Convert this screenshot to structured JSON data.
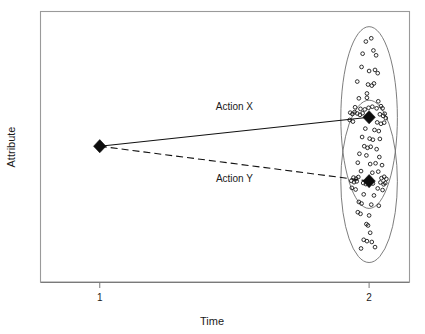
{
  "chart_data": {
    "type": "scatter",
    "title": "",
    "xlabel": "Time",
    "ylabel": "Attribute",
    "xlim": [
      0.78,
      2.15
    ],
    "ylim": [
      0,
      100
    ],
    "grid": false,
    "legend": null,
    "x_ticks": [
      {
        "value": 1,
        "label": "1"
      },
      {
        "value": 2,
        "label": "2"
      }
    ],
    "y_ticks": [],
    "annotations": [
      {
        "text": "Action X",
        "x": 1.5,
        "y": 63.5
      },
      {
        "text": "Action Y",
        "x": 1.5,
        "y": 37.0
      }
    ],
    "series": [
      {
        "name": "Action X",
        "type": "line",
        "style": "solid",
        "marker": "filled-diamond",
        "points": [
          {
            "x": 1.0,
            "y": 50.2
          },
          {
            "x": 2.0,
            "y": 60.9
          }
        ]
      },
      {
        "name": "Action Y",
        "type": "line",
        "style": "dashed",
        "marker": "filled-diamond",
        "points": [
          {
            "x": 1.0,
            "y": 50.2
          },
          {
            "x": 2.0,
            "y": 37.3
          }
        ]
      }
    ],
    "clusters": [
      {
        "name": "Action X outcome cluster",
        "shape": "ellipse",
        "center": {
          "x": 2.0,
          "y": 60.8
        },
        "semi_axis_x": 0.105,
        "semi_axis_y": 33.6,
        "rotation_deg": 0
      },
      {
        "name": "Action Y outcome cluster",
        "shape": "ellipse",
        "center": {
          "x": 2.0,
          "y": 37.2
        },
        "semi_axis_x": 0.105,
        "semi_axis_y": 30.0,
        "rotation_deg": 0
      }
    ],
    "scatter_points": [
      {
        "x": 1.988,
        "y": 88.9
      },
      {
        "x": 2.008,
        "y": 90.1
      },
      {
        "x": 1.976,
        "y": 84.4
      },
      {
        "x": 2.016,
        "y": 85.6
      },
      {
        "x": 2.026,
        "y": 83.8
      },
      {
        "x": 1.972,
        "y": 79.5
      },
      {
        "x": 2.0,
        "y": 78.0
      },
      {
        "x": 2.022,
        "y": 78.4
      },
      {
        "x": 2.032,
        "y": 77.2
      },
      {
        "x": 1.956,
        "y": 74.1
      },
      {
        "x": 1.996,
        "y": 73.0
      },
      {
        "x": 2.01,
        "y": 72.6
      },
      {
        "x": 2.018,
        "y": 73.4
      },
      {
        "x": 1.992,
        "y": 69.7
      },
      {
        "x": 1.992,
        "y": 68.1
      },
      {
        "x": 1.962,
        "y": 67.9
      },
      {
        "x": 2.034,
        "y": 66.8
      },
      {
        "x": 1.948,
        "y": 64.6
      },
      {
        "x": 1.968,
        "y": 64.0
      },
      {
        "x": 1.984,
        "y": 63.8
      },
      {
        "x": 1.998,
        "y": 64.4
      },
      {
        "x": 2.012,
        "y": 64.8
      },
      {
        "x": 2.028,
        "y": 64.2
      },
      {
        "x": 2.044,
        "y": 65.0
      },
      {
        "x": 2.05,
        "y": 64.2
      },
      {
        "x": 1.93,
        "y": 62.6
      },
      {
        "x": 1.938,
        "y": 62.1
      },
      {
        "x": 1.946,
        "y": 62.8
      },
      {
        "x": 1.956,
        "y": 62.3
      },
      {
        "x": 1.966,
        "y": 61.8
      },
      {
        "x": 1.976,
        "y": 62.4
      },
      {
        "x": 2.04,
        "y": 62.0
      },
      {
        "x": 2.052,
        "y": 61.4
      },
      {
        "x": 2.058,
        "y": 62.2
      },
      {
        "x": 2.062,
        "y": 60.6
      },
      {
        "x": 1.928,
        "y": 59.9
      },
      {
        "x": 1.94,
        "y": 59.3
      },
      {
        "x": 2.03,
        "y": 59.0
      },
      {
        "x": 2.044,
        "y": 58.5
      },
      {
        "x": 2.056,
        "y": 58.9
      },
      {
        "x": 1.986,
        "y": 56.7
      },
      {
        "x": 2.02,
        "y": 56.2
      },
      {
        "x": 2.036,
        "y": 55.8
      },
      {
        "x": 1.974,
        "y": 53.6
      },
      {
        "x": 2.002,
        "y": 53.0
      },
      {
        "x": 2.014,
        "y": 52.6
      },
      {
        "x": 2.04,
        "y": 52.9
      },
      {
        "x": 1.982,
        "y": 50.2
      },
      {
        "x": 1.994,
        "y": 49.6
      },
      {
        "x": 2.006,
        "y": 50.0
      },
      {
        "x": 2.028,
        "y": 49.1
      },
      {
        "x": 1.964,
        "y": 47.4
      },
      {
        "x": 1.99,
        "y": 46.8
      },
      {
        "x": 2.038,
        "y": 46.2
      },
      {
        "x": 1.958,
        "y": 44.1
      },
      {
        "x": 2.004,
        "y": 43.6
      },
      {
        "x": 2.024,
        "y": 43.9
      },
      {
        "x": 2.048,
        "y": 43.2
      },
      {
        "x": 1.97,
        "y": 41.0
      },
      {
        "x": 2.012,
        "y": 40.4
      },
      {
        "x": 2.034,
        "y": 40.8
      },
      {
        "x": 1.942,
        "y": 38.6
      },
      {
        "x": 1.952,
        "y": 38.2
      },
      {
        "x": 1.96,
        "y": 38.8
      },
      {
        "x": 2.046,
        "y": 38.4
      },
      {
        "x": 2.056,
        "y": 38.9
      },
      {
        "x": 2.064,
        "y": 38.1
      },
      {
        "x": 1.934,
        "y": 37.4
      },
      {
        "x": 1.944,
        "y": 36.9
      },
      {
        "x": 1.954,
        "y": 37.2
      },
      {
        "x": 1.978,
        "y": 36.6
      },
      {
        "x": 1.988,
        "y": 36.2
      },
      {
        "x": 2.014,
        "y": 36.4
      },
      {
        "x": 2.042,
        "y": 36.8
      },
      {
        "x": 2.054,
        "y": 36.1
      },
      {
        "x": 2.06,
        "y": 36.6
      },
      {
        "x": 1.936,
        "y": 34.8
      },
      {
        "x": 1.95,
        "y": 34.2
      },
      {
        "x": 2.032,
        "y": 34.6
      },
      {
        "x": 2.05,
        "y": 34.0
      },
      {
        "x": 1.98,
        "y": 32.4
      },
      {
        "x": 2.018,
        "y": 32.0
      },
      {
        "x": 1.962,
        "y": 29.6
      },
      {
        "x": 1.972,
        "y": 29.0
      },
      {
        "x": 2.008,
        "y": 28.6
      },
      {
        "x": 2.036,
        "y": 28.2
      },
      {
        "x": 1.958,
        "y": 25.8
      },
      {
        "x": 1.968,
        "y": 25.2
      },
      {
        "x": 2.0,
        "y": 24.6
      },
      {
        "x": 1.99,
        "y": 21.4
      },
      {
        "x": 1.996,
        "y": 20.9
      },
      {
        "x": 2.004,
        "y": 18.2
      },
      {
        "x": 1.98,
        "y": 15.6
      },
      {
        "x": 1.992,
        "y": 15.1
      },
      {
        "x": 2.01,
        "y": 14.8
      },
      {
        "x": 1.97,
        "y": 12.4
      },
      {
        "x": 2.022,
        "y": 12.9
      }
    ]
  },
  "axes": {
    "x_title": "Time",
    "y_title": "Attribute",
    "x_tick_labels": [
      "1",
      "2"
    ]
  },
  "labels": {
    "action_x": "Action X",
    "action_y": "Action Y"
  },
  "colors": {
    "frame": "#9a9a9a",
    "line": "#111111",
    "marker": "#0d0d0d",
    "ellipse": "#6e6e6e",
    "point": "#1a1a1a",
    "text": "#1a1a1a",
    "background": "#ffffff"
  }
}
